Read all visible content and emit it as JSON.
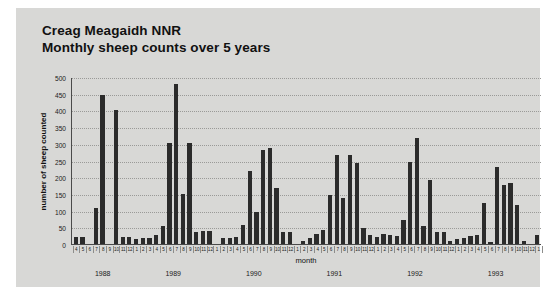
{
  "title": {
    "line1": "Creag Meagaidh NNR",
    "line2": "Monthly sheep counts over 5 years"
  },
  "chart_data": {
    "type": "bar",
    "xlabel": "month",
    "ylabel": "number of sheep counted",
    "ylim": [
      0,
      500
    ],
    "yticks": [
      0,
      50,
      100,
      150,
      200,
      250,
      300,
      350,
      400,
      450,
      500
    ],
    "ytick_labels": [
      "0",
      "50",
      "100",
      "150",
      "200",
      "250",
      "300",
      "350",
      "400",
      "450",
      "500"
    ],
    "grid": true,
    "legend": "none",
    "bar_color": "#2b2b2b",
    "categories": [
      "4",
      "5",
      "6",
      "7",
      "8",
      "9",
      "10",
      "11",
      "12",
      "1",
      "2",
      "3",
      "4",
      "5",
      "6",
      "7",
      "8",
      "9",
      "10",
      "11",
      "12",
      "1",
      "2",
      "3",
      "4",
      "5",
      "6",
      "7",
      "8",
      "9",
      "10",
      "11",
      "12",
      "1",
      "2",
      "3",
      "4",
      "5",
      "6",
      "7",
      "8",
      "9",
      "10",
      "11",
      "12",
      "1",
      "2",
      "3",
      "4",
      "5",
      "6",
      "7",
      "8",
      "9",
      "10",
      "11",
      "12",
      "1",
      "2",
      "3",
      "4",
      "5",
      "6",
      "7",
      "8",
      "9",
      "10",
      "11",
      "12",
      "1"
    ],
    "values": [
      25,
      25,
      0,
      110,
      448,
      0,
      403,
      25,
      25,
      18,
      22,
      20,
      30,
      57,
      305,
      482,
      152,
      305,
      40,
      42,
      42,
      0,
      20,
      22,
      25,
      60,
      222,
      100,
      285,
      290,
      170,
      40,
      38,
      0,
      12,
      20,
      32,
      45,
      150,
      270,
      140,
      270,
      245,
      50,
      30,
      25,
      32,
      30,
      28,
      75,
      250,
      320,
      58,
      195,
      40,
      38,
      12,
      18,
      22,
      26,
      30,
      125,
      10,
      235,
      180,
      185,
      120,
      12,
      0,
      30
    ],
    "year_groups": [
      {
        "label": "1988",
        "count": 9
      },
      {
        "label": "1989",
        "count": 12
      },
      {
        "label": "1990",
        "count": 12
      },
      {
        "label": "1991",
        "count": 12
      },
      {
        "label": "1992",
        "count": 12
      },
      {
        "label": "1993",
        "count": 12
      },
      {
        "label": "",
        "count": 1
      }
    ]
  }
}
